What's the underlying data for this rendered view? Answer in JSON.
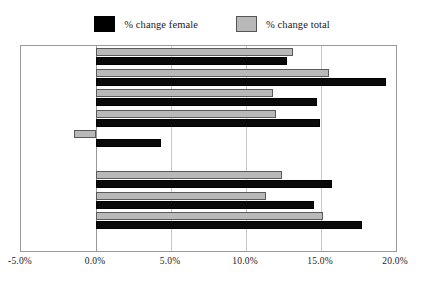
{
  "legend": {
    "position": "top-center",
    "entries": [
      {
        "label": "% change female",
        "color": "#000000",
        "swatch": "female"
      },
      {
        "label": "% change total",
        "color": "#b9b9b9",
        "swatch": "total"
      }
    ]
  },
  "axis": {
    "x_ticks": [
      "-5.0%",
      "0.0%",
      "5.0%",
      "10.0%",
      "15.0%",
      "20.0%"
    ],
    "x_tick_values": [
      -5,
      0,
      5,
      10,
      15,
      20
    ],
    "xmin": -5,
    "xmax": 20
  },
  "chart_data": {
    "type": "bar",
    "orientation": "horizontal",
    "title": "",
    "xlabel": "",
    "ylabel": "",
    "xlim": [
      -5,
      20
    ],
    "grid": true,
    "legend_position": "top-center",
    "categories": [
      "1969/70",
      "1968/69",
      "1967/68",
      "1966/67",
      "1965/66",
      "1964/65",
      "1963/64",
      "1962/63",
      "1961/62",
      "1960/61"
    ],
    "series": [
      {
        "name": "% change total",
        "color": "#b9b9b9",
        "values": [
          13.1,
          15.5,
          11.8,
          12.0,
          -1.5,
          null,
          12.4,
          11.3,
          15.1,
          null
        ]
      },
      {
        "name": "% change female",
        "color": "#000000",
        "values": [
          12.7,
          19.3,
          14.7,
          14.9,
          4.3,
          null,
          15.7,
          14.5,
          17.7,
          null
        ]
      }
    ]
  }
}
